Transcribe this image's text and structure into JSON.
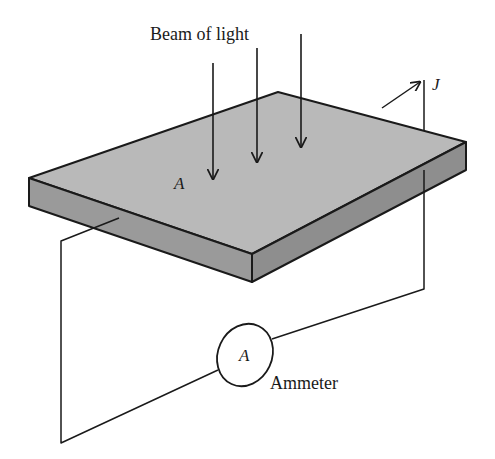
{
  "diagram": {
    "type": "photoelectric-setup",
    "labels": {
      "beam": "Beam of light",
      "surface": "A",
      "current": "J",
      "ammeter_symbol": "A",
      "ammeter": "Ammeter"
    },
    "colors": {
      "stroke": "#1a1a1a",
      "slab_top": "#b9b9b9",
      "slab_front": "#9a9a9a",
      "slab_side": "#8e8e8e",
      "background": "#ffffff"
    },
    "light_arrows": 3
  }
}
